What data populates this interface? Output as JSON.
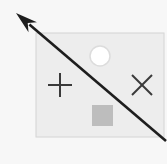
{
  "canvas": {
    "width": 167,
    "height": 164,
    "background_color": "#f7f7f7",
    "title": "Diagram canvas"
  },
  "palette": {
    "background": "#f7f7f7",
    "panel_fill": "#ededed",
    "panel_stroke": "#d4d4d4",
    "stroke_dark": "#3a3a3a",
    "circle_fill": "#ffffff",
    "circle_stroke": "#dcdcdc",
    "square_fill": "#bdbdbd"
  },
  "shapes": {
    "panel": {
      "name": "Rectangle panel",
      "x": 36,
      "y": 33,
      "width": 128,
      "height": 104,
      "fill": "#ededed",
      "stroke": "#d4d4d4",
      "stroke_width": 1
    },
    "circle": {
      "name": "Circle",
      "cx": 100,
      "cy": 56,
      "r": 10,
      "fill": "#ffffff",
      "stroke": "#dcdcdc",
      "stroke_width": 1.5
    },
    "plus": {
      "name": "Plus mark",
      "cx": 60,
      "cy": 85,
      "arm": 12,
      "stroke": "#3a3a3a",
      "stroke_width": 2
    },
    "cross": {
      "name": "X mark",
      "cx": 142,
      "cy": 85,
      "arm": 10,
      "stroke": "#3a3a3a",
      "stroke_width": 2
    },
    "square": {
      "name": "Gray square",
      "x": 92,
      "y": 105,
      "width": 21,
      "height": 21,
      "fill": "#bdbdbd"
    },
    "arrow": {
      "name": "Diagonal arrow",
      "x1": 166,
      "y1": 141,
      "x2": 16,
      "y2": 13,
      "stroke": "#1e1e1e",
      "stroke_width": 2.6,
      "head_length": 22,
      "head_width": 13,
      "direction": "up-left"
    }
  }
}
